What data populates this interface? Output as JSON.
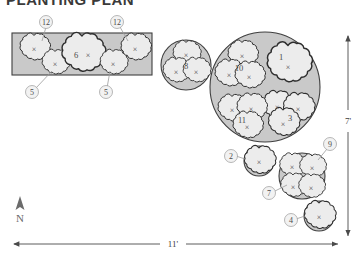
{
  "title": "PLANTING PLAN",
  "north": {
    "label": "N",
    "icon": "north-arrow-icon"
  },
  "dimensions": {
    "width_label": "11'",
    "height_label": "7'"
  },
  "colors": {
    "bed_fill": "#c9c9c9",
    "bed_stroke": "#3f3f3f",
    "plant_fill": "#ececec",
    "plant_stroke": "#2e2e2e",
    "callout_fill": "#f2f2f2",
    "callout_stroke": "#9a9a9a",
    "leader": "#9a9a9a",
    "text": "#4a4a4a",
    "page_bg": "#ffffff"
  },
  "beds": [
    {
      "name": "rectangular-bed",
      "shape": "rectangle"
    },
    {
      "name": "small-round-bed",
      "shape": "circle"
    },
    {
      "name": "large-round-bed",
      "shape": "circle"
    },
    {
      "name": "bed-two",
      "shape": "circle"
    },
    {
      "name": "bed-nine",
      "shape": "circle"
    },
    {
      "name": "bed-four",
      "shape": "circle"
    }
  ],
  "plant_labels": {
    "rect_left_top": "12",
    "rect_left_bottom": "5",
    "rect_center": "6",
    "rect_right_bottom": "5",
    "rect_right_top": "12",
    "small_round": "8",
    "big_one": "1",
    "big_ten": "10",
    "big_three": "3",
    "big_eleven": "11",
    "bed_two": "2",
    "bed_nine": "9",
    "bed_seven": "7",
    "bed_four": "4"
  }
}
